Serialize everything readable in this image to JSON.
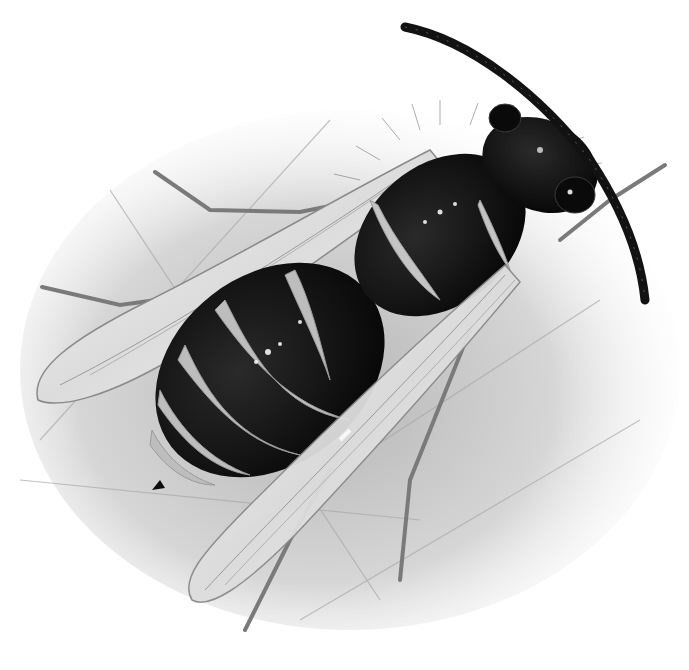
{
  "image": {
    "subject": "pencil illustration of a wasp (top-down view) on a leaf",
    "style": "graphite / greyscale drawing",
    "background_color": "#ffffff",
    "palette": {
      "body_black": "#0d0d0d",
      "band_grey": "#bdbdbd",
      "leaf_shadow": "#c9c9c9",
      "wing_fill": "#e9e9e9",
      "wing_edge": "#8a8a8a",
      "leg_grey": "#7a7a7a"
    }
  },
  "caption_crop": {
    "text": "",
    "note": "only descenders of a cut-off line of text are visible at the top edge"
  },
  "parts": {
    "antennae": 1,
    "wings_visible": 2,
    "legs_visible": 5,
    "abdomen_bands": 5
  }
}
